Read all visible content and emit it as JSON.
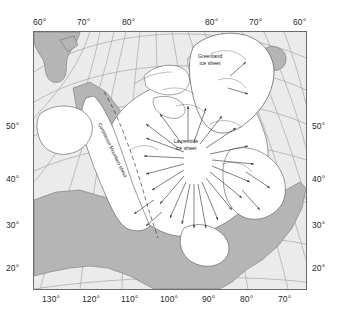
{
  "figure": {
    "kind": "paleogeographic-map",
    "projection_note": "polar-style curved graticule"
  },
  "colors": {
    "ocean": "#ebebeb",
    "land_ice_free": "#b5b5b5",
    "ice_sheet": "#ffffff",
    "graticule": "#9a9a9a",
    "coastline": "#555555",
    "frame": "#6b6b6b",
    "arrow": "#4a4a4a",
    "text": "#1f1f1f"
  },
  "axes": {
    "top": [
      {
        "label": "60°",
        "x": 33
      },
      {
        "label": "70°",
        "x": 77
      },
      {
        "label": "80°",
        "x": 122
      },
      {
        "label": "80°",
        "x": 205
      },
      {
        "label": "70°",
        "x": 249
      },
      {
        "label": "60°",
        "x": 293
      }
    ],
    "bottom": [
      {
        "label": "130°",
        "x": 42
      },
      {
        "label": "120°",
        "x": 82
      },
      {
        "label": "110°",
        "x": 121
      },
      {
        "label": "100°",
        "x": 160
      },
      {
        "label": "90°",
        "x": 202
      },
      {
        "label": "80°",
        "x": 240
      },
      {
        "label": "70°",
        "x": 278
      }
    ],
    "left": [
      {
        "label": "50°",
        "y": 122
      },
      {
        "label": "40°",
        "y": 175
      },
      {
        "label": "30°",
        "y": 221
      },
      {
        "label": "20°",
        "y": 264
      }
    ],
    "right": [
      {
        "label": "50°",
        "y": 122
      },
      {
        "label": "40°",
        "y": 175
      },
      {
        "label": "30°",
        "y": 221
      },
      {
        "label": "20°",
        "y": 264
      }
    ]
  },
  "map_labels": {
    "greenland_ice_sheet_line1": "Greenland",
    "greenland_ice_sheet_line2": "ice sheet",
    "laurentide_ice_sheet_line1": "Laurentide",
    "laurentide_ice_sheet_line2": "ice sheet",
    "cordilleran_range": "Cordilleran Mountain sheet"
  },
  "features": {
    "ice_sheets": [
      "Laurentide ice sheet",
      "Greenland ice sheet",
      "Cordilleran Mountain sheet"
    ],
    "flow_arrows_count": 26,
    "ice_margin_style": "dashed line along western Cordilleran margin"
  }
}
